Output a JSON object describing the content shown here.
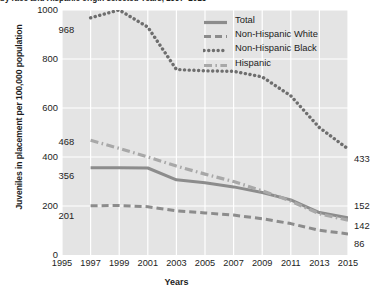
{
  "chart_data": {
    "type": "line",
    "title": "by race and Hispanic origin selected Years, 1997–2015",
    "xlabel": "Years",
    "ylabel": "Juveniles in placement per 100,000 population",
    "xlim": [
      1995,
      2015
    ],
    "ylim": [
      0,
      1000
    ],
    "yticks": [
      0,
      200,
      400,
      600,
      800,
      1000
    ],
    "xticks": [
      1995,
      1997,
      1999,
      2001,
      2003,
      2005,
      2007,
      2009,
      2011,
      2013,
      2015
    ],
    "grid": true,
    "legend_position": "top-right",
    "x": [
      1997,
      1999,
      2001,
      2003,
      2005,
      2007,
      2009,
      2011,
      2013,
      2015
    ],
    "series": [
      {
        "name": "Total",
        "style": "solid",
        "color": "#8c8c8c",
        "values": [
          356,
          356,
          355,
          307,
          295,
          278,
          255,
          225,
          173,
          152
        ],
        "start_label": "356",
        "end_label": "152"
      },
      {
        "name": "Non-Hispanic White",
        "style": "dashed",
        "color": "#8c8c8c",
        "values": [
          201,
          202,
          197,
          180,
          172,
          163,
          148,
          128,
          101,
          86
        ],
        "start_label": "201",
        "end_label": "86"
      },
      {
        "name": "Non-Hispanic Black",
        "style": "dotted",
        "color": "#6e6e6e",
        "values": [
          968,
          1000,
          930,
          757,
          752,
          750,
          727,
          650,
          520,
          433
        ],
        "start_label": "968",
        "end_label": "433"
      },
      {
        "name": "Hispanic",
        "style": "dashdot",
        "color": "#a8a8a8",
        "values": [
          468,
          435,
          400,
          363,
          330,
          300,
          262,
          220,
          168,
          142
        ],
        "start_label": "468",
        "end_label": "142"
      }
    ],
    "annotations": [
      {
        "text": "968",
        "series": "Non-Hispanic Black",
        "position": "start"
      },
      {
        "text": "468",
        "series": "Hispanic",
        "position": "start"
      },
      {
        "text": "356",
        "series": "Total",
        "position": "start"
      },
      {
        "text": "201",
        "series": "Non-Hispanic White",
        "position": "start"
      },
      {
        "text": "433",
        "series": "Non-Hispanic Black",
        "position": "end"
      },
      {
        "text": "152",
        "series": "Total",
        "position": "end"
      },
      {
        "text": "142",
        "series": "Hispanic",
        "position": "end"
      },
      {
        "text": "86",
        "series": "Non-Hispanic White",
        "position": "end"
      }
    ]
  },
  "colors": {
    "plot_background": "#e4e4e4",
    "gridline": "#ffffff",
    "text": "#1d1d1d"
  }
}
